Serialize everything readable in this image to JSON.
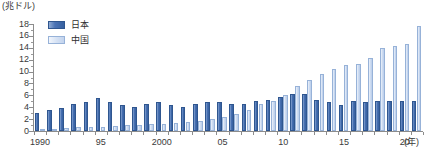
{
  "chart_data": {
    "type": "bar",
    "title": "",
    "subtitle": "",
    "unit_label": "(兆ドル)",
    "xlabel": "(年)",
    "ylabel": "",
    "ylim": [
      0,
      18
    ],
    "ytick_step": 2,
    "grid": false,
    "legend_position": "top-left",
    "categories": [
      "1990",
      "1991",
      "1992",
      "1993",
      "1994",
      "1995",
      "1996",
      "1997",
      "1998",
      "1999",
      "2000",
      "2001",
      "2002",
      "2003",
      "2004",
      "2005",
      "2006",
      "2007",
      "2008",
      "2009",
      "2010",
      "2011",
      "2012",
      "2013",
      "2014",
      "2015",
      "2016",
      "2017",
      "2018",
      "2019",
      "2020",
      "2021"
    ],
    "x_tick_labels": [
      {
        "category": "1990",
        "label": "1990"
      },
      {
        "category": "1995",
        "label": "95"
      },
      {
        "category": "2000",
        "label": "2000"
      },
      {
        "category": "2005",
        "label": "05"
      },
      {
        "category": "2010",
        "label": "10"
      },
      {
        "category": "2015",
        "label": "15"
      },
      {
        "category": "2020",
        "label": "20"
      }
    ],
    "y_tick_labels": [
      "0",
      "2",
      "4",
      "6",
      "8",
      "10",
      "12",
      "14",
      "16",
      "18"
    ],
    "series": [
      {
        "name": "日本",
        "color": "#4a72b4",
        "values": [
          3.1,
          3.6,
          3.9,
          4.5,
          4.9,
          5.5,
          4.8,
          4.4,
          4.0,
          4.6,
          4.9,
          4.3,
          4.1,
          4.5,
          4.8,
          4.8,
          4.6,
          4.5,
          5.1,
          5.2,
          5.8,
          6.2,
          6.3,
          5.2,
          4.9,
          4.4,
          5.0,
          4.9,
          5.0,
          5.1,
          5.0,
          5.0
        ]
      },
      {
        "name": "中国",
        "color": "#cfddf2",
        "values": [
          0.4,
          0.4,
          0.5,
          0.6,
          0.6,
          0.7,
          0.9,
          1.0,
          1.0,
          1.1,
          1.2,
          1.3,
          1.5,
          1.7,
          2.0,
          2.3,
          2.8,
          3.6,
          4.6,
          5.1,
          6.1,
          7.6,
          8.5,
          9.6,
          10.5,
          11.1,
          11.2,
          12.3,
          13.9,
          14.3,
          14.7,
          17.7
        ]
      }
    ]
  },
  "legend": {
    "items": [
      {
        "label": "日本",
        "key": "jp"
      },
      {
        "label": "中国",
        "key": "cn"
      }
    ]
  }
}
